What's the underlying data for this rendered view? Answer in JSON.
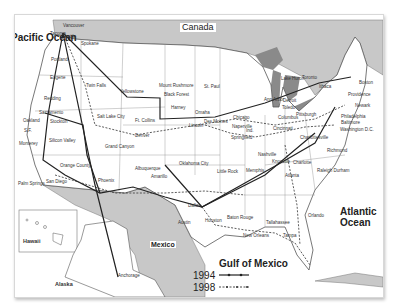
{
  "map": {
    "title": "US route map 1994 vs 1998",
    "regions": {
      "canada": "Canada",
      "pacific": "Pacific Ocean",
      "atlantic": "Atlantic Ocean",
      "gulf": "Gulf of Mexico",
      "mexico": "Mexico",
      "hawaii": "Hawaii",
      "alaska": "Alaska"
    },
    "legend": [
      {
        "year": "1994",
        "style": "solid"
      },
      {
        "year": "1998",
        "style": "dashed"
      }
    ],
    "colors": {
      "water": "#ffffff",
      "foreign_land": "#c8c8c8",
      "lakes": "#8a8a8a",
      "route": "#222222",
      "border": "#777777"
    },
    "cities": [
      {
        "name": "Vancouver",
        "x": 62,
        "y": 23
      },
      {
        "name": "Tacoma",
        "x": 49,
        "y": 31
      },
      {
        "name": "Seattle",
        "x": 61,
        "y": 34
      },
      {
        "name": "Spokane",
        "x": 80,
        "y": 41
      },
      {
        "name": "Portland",
        "x": 50,
        "y": 57
      },
      {
        "name": "Eugene",
        "x": 49,
        "y": 75
      },
      {
        "name": "Twin Falls",
        "x": 85,
        "y": 83
      },
      {
        "name": "Yellowstone",
        "x": 119,
        "y": 89
      },
      {
        "name": "Mount Rushmore",
        "x": 158,
        "y": 83
      },
      {
        "name": "Black Forest",
        "x": 163,
        "y": 92
      },
      {
        "name": "St. Paul",
        "x": 203,
        "y": 84
      },
      {
        "name": "Redding",
        "x": 43,
        "y": 96
      },
      {
        "name": "Sacramento",
        "x": 38,
        "y": 110
      },
      {
        "name": "Oakland",
        "x": 22,
        "y": 118
      },
      {
        "name": "Stockton",
        "x": 49,
        "y": 119
      },
      {
        "name": "S.F.",
        "x": 23,
        "y": 128
      },
      {
        "name": "Salt Lake City",
        "x": 96,
        "y": 114
      },
      {
        "name": "Monterey",
        "x": 18,
        "y": 141
      },
      {
        "name": "Silicon Valley",
        "x": 48,
        "y": 138
      },
      {
        "name": "Harney",
        "x": 170,
        "y": 105
      },
      {
        "name": "Omaha",
        "x": 194,
        "y": 110
      },
      {
        "name": "Ft. Collins",
        "x": 134,
        "y": 118
      },
      {
        "name": "Lincoln",
        "x": 188,
        "y": 123
      },
      {
        "name": "Des Moines",
        "x": 203,
        "y": 119
      },
      {
        "name": "Denver",
        "x": 134,
        "y": 133
      },
      {
        "name": "Chicago",
        "x": 232,
        "y": 115
      },
      {
        "name": "Naperville",
        "x": 231,
        "y": 124
      },
      {
        "name": "Springfield",
        "x": 230,
        "y": 135
      },
      {
        "name": "Ind.",
        "x": 245,
        "y": 128
      },
      {
        "name": "Grand Canyon",
        "x": 104,
        "y": 144
      },
      {
        "name": "Orange County",
        "x": 59,
        "y": 163
      },
      {
        "name": "Palm Springs",
        "x": 17,
        "y": 181
      },
      {
        "name": "San Diego",
        "x": 45,
        "y": 179
      },
      {
        "name": "Phoenix",
        "x": 97,
        "y": 178
      },
      {
        "name": "Albuquerque",
        "x": 134,
        "y": 166
      },
      {
        "name": "Oklahoma City",
        "x": 178,
        "y": 161
      },
      {
        "name": "Amarillo",
        "x": 150,
        "y": 174
      },
      {
        "name": "Little Rock",
        "x": 216,
        "y": 169
      },
      {
        "name": "Memphis",
        "x": 245,
        "y": 168
      },
      {
        "name": "Nashville",
        "x": 257,
        "y": 152
      },
      {
        "name": "Knoxville",
        "x": 271,
        "y": 159
      },
      {
        "name": "Dallas",
        "x": 187,
        "y": 203
      },
      {
        "name": "Austin",
        "x": 177,
        "y": 220
      },
      {
        "name": "Houston",
        "x": 204,
        "y": 218
      },
      {
        "name": "Baton Rouge",
        "x": 226,
        "y": 215
      },
      {
        "name": "New Orleans",
        "x": 242,
        "y": 233
      },
      {
        "name": "Tallahassee",
        "x": 265,
        "y": 220
      },
      {
        "name": "Tampa",
        "x": 282,
        "y": 233
      },
      {
        "name": "Orlando",
        "x": 307,
        "y": 213
      },
      {
        "name": "Charlotte",
        "x": 292,
        "y": 160
      },
      {
        "name": "Atlanta",
        "x": 284,
        "y": 173
      },
      {
        "name": "Raleigh Durham",
        "x": 316,
        "y": 168
      },
      {
        "name": "Richmond",
        "x": 326,
        "y": 148
      },
      {
        "name": "Charlottesville",
        "x": 299,
        "y": 135
      },
      {
        "name": "Columbus",
        "x": 277,
        "y": 115
      },
      {
        "name": "Pittsburgh",
        "x": 295,
        "y": 112
      },
      {
        "name": "Cincinnati",
        "x": 272,
        "y": 126
      },
      {
        "name": "Detroit",
        "x": 282,
        "y": 98
      },
      {
        "name": "Ann Arbor",
        "x": 263,
        "y": 97
      },
      {
        "name": "Toledo",
        "x": 281,
        "y": 105
      },
      {
        "name": "Lake Huron",
        "x": 280,
        "y": 76
      },
      {
        "name": "Toronto",
        "x": 301,
        "y": 75
      },
      {
        "name": "Ithaca",
        "x": 318,
        "y": 84
      },
      {
        "name": "Boston",
        "x": 358,
        "y": 80
      },
      {
        "name": "Providence",
        "x": 347,
        "y": 92
      },
      {
        "name": "Newark",
        "x": 354,
        "y": 103
      },
      {
        "name": "Philadelphia",
        "x": 340,
        "y": 114
      },
      {
        "name": "Baltimore",
        "x": 340,
        "y": 120
      },
      {
        "name": "Washington D.C.",
        "x": 339,
        "y": 127
      },
      {
        "name": "Anchorage",
        "x": 117,
        "y": 273
      }
    ]
  }
}
